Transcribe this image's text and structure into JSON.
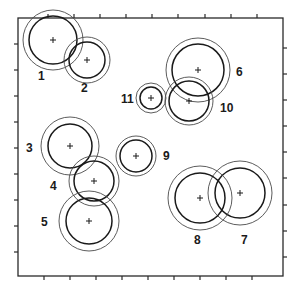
{
  "diagram": {
    "frame": {
      "x1": 18,
      "y1": 18,
      "x2": 283,
      "y2": 276
    },
    "ticks": {
      "top": [
        48,
        74,
        100,
        126,
        152,
        178,
        205,
        231,
        257
      ],
      "bottom": [
        44,
        70,
        96,
        122,
        148,
        174,
        200,
        226,
        252
      ],
      "left": [
        44,
        70,
        96,
        122,
        148,
        174,
        200,
        226,
        252
      ],
      "right": [
        48,
        74,
        100,
        126,
        152,
        178,
        205,
        231,
        257
      ],
      "length": 4
    },
    "circles": [
      {
        "id": "1",
        "cx": 53,
        "cy": 40,
        "r_outer": 30,
        "r_inner": 24,
        "label": "1",
        "lx": 38,
        "ly": 80
      },
      {
        "id": "2",
        "cx": 87,
        "cy": 60,
        "r_outer": 23,
        "r_inner": 18,
        "label": "2",
        "lx": 81,
        "ly": 92
      },
      {
        "id": "3",
        "cx": 70,
        "cy": 146,
        "r_outer": 29,
        "r_inner": 22,
        "label": "3",
        "lx": 26,
        "ly": 152
      },
      {
        "id": "4",
        "cx": 94,
        "cy": 181,
        "r_outer": 25,
        "r_inner": 20,
        "label": "4",
        "lx": 50,
        "ly": 190
      },
      {
        "id": "5",
        "cx": 89,
        "cy": 221,
        "r_outer": 30,
        "r_inner": 23,
        "label": "5",
        "lx": 41,
        "ly": 226
      },
      {
        "id": "6",
        "cx": 198,
        "cy": 70,
        "r_outer": 32,
        "r_inner": 26,
        "label": "6",
        "lx": 236,
        "ly": 76
      },
      {
        "id": "7",
        "cx": 240,
        "cy": 193,
        "r_outer": 32,
        "r_inner": 25,
        "label": "7",
        "lx": 241,
        "ly": 244
      },
      {
        "id": "8",
        "cx": 200,
        "cy": 198,
        "r_outer": 32,
        "r_inner": 25,
        "label": "8",
        "lx": 194,
        "ly": 244
      },
      {
        "id": "9",
        "cx": 136,
        "cy": 156,
        "r_outer": 20,
        "r_inner": 16,
        "label": "9",
        "lx": 163,
        "ly": 160
      },
      {
        "id": "10",
        "cx": 189,
        "cy": 101,
        "r_outer": 24,
        "r_inner": 20,
        "label": "10",
        "lx": 220,
        "ly": 112
      },
      {
        "id": "11",
        "cx": 151,
        "cy": 98,
        "r_outer": 15,
        "r_inner": 11,
        "label": "11",
        "lx": 121,
        "ly": 103
      }
    ],
    "colors": {
      "stroke": "#1a1a1a",
      "background": "#ffffff"
    }
  }
}
